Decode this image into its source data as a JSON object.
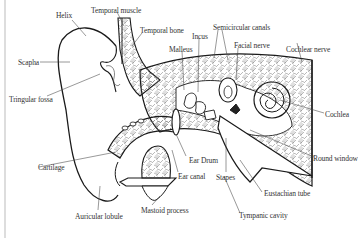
{
  "diagram": {
    "labels": {
      "helix": "Helix",
      "temporal_muscle": "Temporal muscle",
      "temporal_bone": "Temporal bone",
      "semicircular_canals": "Semicircular canals",
      "incus": "Incus",
      "malleus": "Malleus",
      "facial_nerve": "Facial nerve",
      "cochlear_nerve": "Cochlear nerve",
      "scapha": "Scapha",
      "tringular_fossa": "Tringular fossa",
      "cochlea": "Cochlea",
      "round_window": "Round window",
      "cartilage": "Cartilage",
      "ear_drum": "Ear Drum",
      "ear_canal": "Ear canal",
      "stapes": "Stapes",
      "eustachian_tube": "Eustachian tube",
      "auricular_lobule": "Auricular lobule",
      "mastoid_process": "Mastoid process",
      "tympanic_cavity": "Tympanic cavity"
    },
    "colors": {
      "line": "#1a1a1a",
      "leader": "#444444",
      "hatch": "#777777",
      "text": "#333333",
      "border": "#bbbbbb"
    }
  }
}
